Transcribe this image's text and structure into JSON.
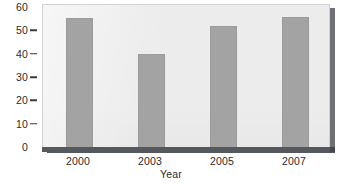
{
  "chart_data": {
    "type": "bar",
    "title": "",
    "subtitle": "",
    "categories": [
      "2000",
      "2003",
      "2005",
      "2007"
    ],
    "values": [
      55,
      39.5,
      51.5,
      55.5
    ],
    "xlabel": "Year",
    "ylabel": "",
    "ylim": [
      0,
      60
    ],
    "ytick_labels": [
      "0",
      "10",
      "20",
      "30",
      "40",
      "50",
      "60"
    ],
    "ytick_values": [
      0,
      10,
      20,
      30,
      40,
      50,
      60
    ],
    "grid": false,
    "legend": null,
    "annotations": [],
    "style": {
      "bar_color": "#a3a3a3",
      "panel_background": "#ececec",
      "panel_border": "#d2d2d2",
      "axis_color": "#55585c",
      "text_color": "#2b2b2b",
      "page_background": "#ffffff"
    }
  }
}
